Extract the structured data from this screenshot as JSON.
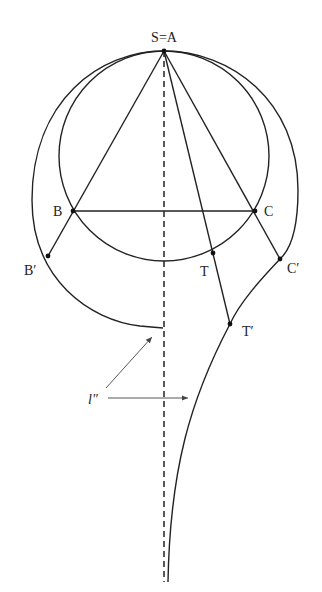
{
  "figure": {
    "labels": {
      "apex": "S=A",
      "B": "B",
      "C": "C",
      "B_prime": "B′",
      "C_prime": "C′",
      "T": "T",
      "T_prime": "T′",
      "line": "l″"
    },
    "points": {
      "apex": [
        164,
        51
      ],
      "B": [
        73,
        211
      ],
      "C": [
        255,
        211
      ],
      "B_prime": [
        48,
        256
      ],
      "C_prime": [
        280,
        259
      ],
      "T": [
        213,
        253
      ],
      "T_prime": [
        230,
        324
      ]
    },
    "inner_circle": {
      "cx": 164,
      "cy": 156,
      "r": 105
    },
    "dashed_axis": {
      "x": 164,
      "y_top": 51,
      "y_bottom": 582
    },
    "stroke_color": "#222222",
    "background": "#ffffff"
  }
}
